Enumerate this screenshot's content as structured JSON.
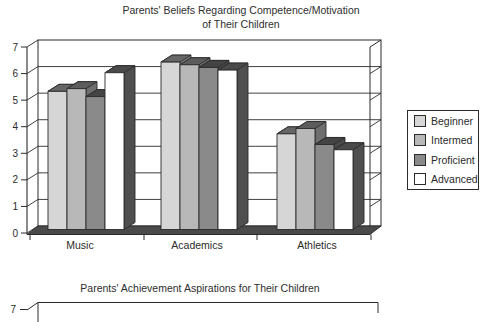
{
  "chart_data": [
    {
      "type": "bar",
      "title": "Parents' Beliefs Regarding Competence/Motivation of Their Children",
      "title_line1": "Parents' Beliefs Regarding Competence/Motivation",
      "title_line2": "of Their Children",
      "categories": [
        "Music",
        "Academics",
        "Athletics"
      ],
      "series": [
        {
          "name": "Beginner",
          "values": [
            5.2,
            6.3,
            3.6
          ]
        },
        {
          "name": "Intermed",
          "values": [
            5.3,
            6.2,
            3.8
          ]
        },
        {
          "name": "Proficient",
          "values": [
            5.0,
            6.1,
            3.2
          ]
        },
        {
          "name": "Advanced",
          "values": [
            5.9,
            6.0,
            3.0
          ]
        }
      ],
      "y_ticks": [
        "0",
        "1",
        "2",
        "3",
        "4",
        "5",
        "6",
        "7"
      ],
      "ylim": [
        0,
        7
      ],
      "grid": "horizontal",
      "legend_position": "right",
      "projection": "3d-column"
    },
    {
      "type": "bar",
      "title": "Parents' Achievement Aspirations for Their Children",
      "note_visible": "only chart top edge visible (cut off)",
      "visible_y_ticks": [
        "7"
      ]
    }
  ],
  "style": {
    "series": [
      {
        "name": "Beginner",
        "face": "#d6d6d6",
        "side": "#7d7d7d",
        "top": "#666666"
      },
      {
        "name": "Intermed",
        "face": "#b8b8b8",
        "side": "#6e6e6e",
        "top": "#5c5c5c"
      },
      {
        "name": "Proficient",
        "face": "#8a8a8a",
        "side": "#4a4a4a",
        "top": "#444444"
      },
      {
        "name": "Advanced",
        "face": "#ffffff",
        "side": "#4f4f4f",
        "top": "#4a4a4a"
      }
    ],
    "line_color": "#2b2b2b",
    "floor_color": "#4a4a4a",
    "background": "#ffffff",
    "text_color": "#2b2b2b"
  }
}
